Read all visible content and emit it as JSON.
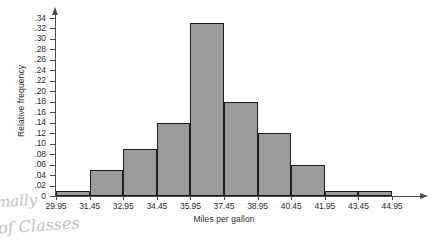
{
  "chart_data": {
    "type": "bar",
    "title": "",
    "xlabel": "Miles per gallon",
    "ylabel": "Relative frequency",
    "categories": [
      "29.95-31.45",
      "31.45-32.95",
      "32.95-34.45",
      "34.45-35.95",
      "35.95-37.45",
      "37.45-38.95",
      "38.95-40.45",
      "40.45-41.95",
      "41.95-43.45",
      "43.45-44.95"
    ],
    "values": [
      0.01,
      0.05,
      0.09,
      0.14,
      0.33,
      0.18,
      0.12,
      0.06,
      0.01,
      0.01
    ],
    "bin_edges": [
      29.95,
      31.45,
      32.95,
      34.45,
      35.95,
      37.45,
      38.95,
      40.45,
      41.95,
      43.45,
      44.95
    ],
    "bin_width": 1.5,
    "xlim": [
      29.95,
      44.95
    ],
    "ylim": [
      0,
      0.34
    ],
    "y_tick_step": 0.02,
    "x_tick_labels": [
      "29.95",
      "31.45",
      "32.95",
      "34.45",
      "35.95",
      "37.45",
      "38.95",
      "40.45",
      "41.95",
      "43.45",
      "44.95"
    ],
    "y_tick_labels": [
      ".34",
      ".32",
      ".30",
      ".28",
      ".26",
      ".24",
      ".22",
      ".20",
      ".18",
      ".16",
      ".14",
      ".12",
      ".10",
      ".08",
      ".06",
      ".04",
      ".02",
      "0"
    ],
    "y_tick_values": [
      0.34,
      0.32,
      0.3,
      0.28,
      0.26,
      0.24,
      0.22,
      0.2,
      0.18,
      0.16,
      0.14,
      0.12,
      0.1,
      0.08,
      0.06,
      0.04,
      0.02,
      0
    ],
    "grid": false,
    "legend": "none",
    "bar_fill_color": "#9a9a9a",
    "bar_edge_color": "#1c1c1c",
    "axis_color": "#4a4a4a"
  },
  "annotations": {
    "handwriting_line_1": "mally",
    "handwriting_line_2": "of Classes"
  }
}
